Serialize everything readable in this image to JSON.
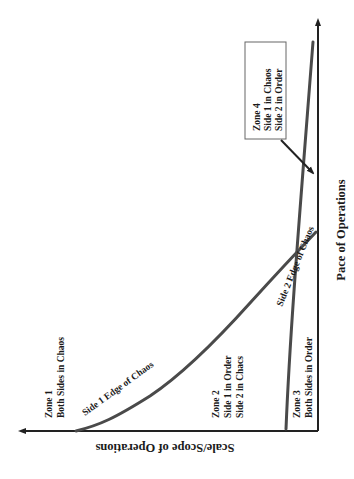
{
  "diagram": {
    "type": "zone-diagram",
    "axes": {
      "x_label": "Scale/Scope of Operations",
      "y_label": "Pace of Operations"
    },
    "curves": [
      {
        "id": "side1",
        "label": "Side 1 Edge of Chaos"
      },
      {
        "id": "side2",
        "label": "Side 2 Edge of Chaos"
      }
    ],
    "zones": [
      {
        "title": "Zone 1",
        "lines": [
          "Both Sides in Chaos"
        ]
      },
      {
        "title": "Zone 2",
        "lines": [
          "Side 1 in Order",
          "Side 2 in Chacs"
        ]
      },
      {
        "title": "Zone 3",
        "lines": [
          "Both Sides in Order"
        ]
      },
      {
        "title": "Zone 4",
        "lines": [
          "Side 1 in Chaos",
          "Side 2 in Order"
        ]
      }
    ],
    "colors": {
      "axis": "#222222",
      "curve": "#4a4a4a",
      "box_border": "#555555",
      "text": "#1a1a1a"
    }
  }
}
